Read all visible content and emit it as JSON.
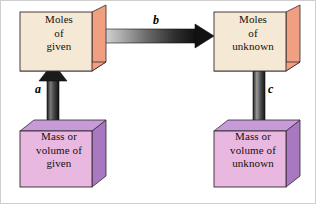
{
  "diagram": {
    "background_color": "#ffffff",
    "border_color": "#cfcfcf",
    "boxes": [
      {
        "id": "moles-given",
        "text": "Moles\nof\ngiven",
        "lines": [
          "Moles",
          "of",
          "given"
        ],
        "position": "top-left",
        "face_color": "#f5e8d5",
        "side_color": "#f0a080",
        "edge_color": "#3a2f28"
      },
      {
        "id": "moles-unknown",
        "text": "Moles\nof\nunknown",
        "lines": [
          "Moles",
          "of",
          "unknown"
        ],
        "position": "top-right",
        "face_color": "#f5e8d5",
        "side_color": "#f0a080",
        "edge_color": "#3a2f28"
      },
      {
        "id": "mass-given",
        "text": "Mass or\nvolume of\ngiven",
        "lines": [
          "Mass or",
          "volume of",
          "given"
        ],
        "position": "bottom-left",
        "face_color": "#e8b8e0",
        "side_color": "#a878c0",
        "edge_color": "#3a2f28"
      },
      {
        "id": "mass-unknown",
        "text": "Mass or\nvolume of\nunknown",
        "lines": [
          "Mass or",
          "volume of",
          "unknown"
        ],
        "position": "bottom-right",
        "face_color": "#e8b8e0",
        "side_color": "#a878c0",
        "edge_color": "#3a2f28"
      }
    ],
    "arrows": [
      {
        "id": "a",
        "label": "a",
        "direction": "up",
        "from": "mass-given",
        "to": "moles-given",
        "color_start": "#6e6e6e",
        "color_end": "#1a1a1a"
      },
      {
        "id": "b",
        "label": "b",
        "direction": "right",
        "from": "moles-given",
        "to": "moles-unknown",
        "color_start": "#d8d8d8",
        "color_end": "#121212"
      },
      {
        "id": "c",
        "label": "c",
        "direction": "down",
        "from": "moles-unknown",
        "to": "mass-unknown",
        "color_start": "#8a8a8a",
        "color_end": "#1a1a1a"
      }
    ]
  }
}
